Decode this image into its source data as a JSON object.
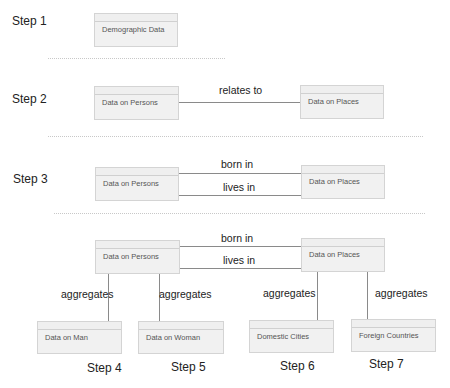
{
  "steps": {
    "s1": "Step 1",
    "s2": "Step 2",
    "s3": "Step 3",
    "s4": "Step 4",
    "s5": "Step 5",
    "s6": "Step 6",
    "s7": "Step 7"
  },
  "entities": {
    "demographic": "Demographic Data",
    "persons": "Data on Persons",
    "places": "Data on Places",
    "man": "Data on Man",
    "woman": "Data on Woman",
    "domestic": "Domestic Cities",
    "foreign": "Foreign Countries"
  },
  "relations": {
    "relates_to": "relates to",
    "born_in": "born in",
    "lives_in": "lives in",
    "aggregates": "aggregates"
  }
}
